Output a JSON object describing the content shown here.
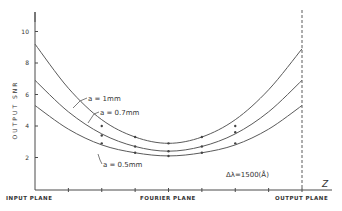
{
  "chart_data": {
    "type": "line",
    "title": "",
    "xlabel": "Z",
    "ylabel": "OUTPUT SNR",
    "ylim": [
      0,
      11
    ],
    "xlim": [
      0,
      8
    ],
    "y_ticks": [
      "2",
      "4",
      "6",
      "8",
      "10"
    ],
    "y_tick_values": [
      2,
      4,
      6,
      8,
      10
    ],
    "x_tick_values": [
      1,
      2,
      3,
      4,
      5,
      6,
      7,
      8
    ],
    "x_plane_labels": [
      {
        "label": "INPUT PLANE",
        "x": 0
      },
      {
        "label": "FOURIER PLANE",
        "x": 4
      },
      {
        "label": "OUTPUT PLANE",
        "x": 8
      }
    ],
    "annotation": "Δλ=1500(Å)",
    "output_plane_marker_x": 8,
    "series": [
      {
        "name": "a=1mm",
        "x": [
          0,
          1,
          2,
          3,
          4,
          5,
          6,
          7,
          8
        ],
        "values": [
          9.2,
          6.4,
          4.4,
          3.3,
          2.9,
          3.3,
          4.4,
          6.3,
          8.9
        ],
        "markers_x": [
          2,
          3,
          4,
          5,
          6
        ],
        "markers_y": [
          4.0,
          3.3,
          2.9,
          3.3,
          4.0
        ]
      },
      {
        "name": "a=0.7mm",
        "x": [
          0,
          1,
          2,
          3,
          4,
          5,
          6,
          7,
          8
        ],
        "values": [
          6.9,
          4.9,
          3.5,
          2.7,
          2.4,
          2.7,
          3.5,
          4.9,
          6.9
        ],
        "markers_x": [
          2,
          3,
          4,
          5,
          6
        ],
        "markers_y": [
          3.4,
          2.7,
          2.4,
          2.7,
          3.6
        ]
      },
      {
        "name": "a=0.5mm",
        "x": [
          0,
          1,
          2,
          3,
          4,
          5,
          6,
          7,
          8
        ],
        "values": [
          5.3,
          3.8,
          2.8,
          2.3,
          2.1,
          2.3,
          2.8,
          3.8,
          5.3
        ],
        "markers_x": [
          2,
          3,
          4,
          5,
          6
        ],
        "markers_y": [
          2.9,
          2.3,
          2.1,
          2.3,
          2.9
        ]
      }
    ],
    "curve_labels": [
      "a = 1mm",
      "a = 0.7mm",
      "a = 0.5mm"
    ]
  }
}
